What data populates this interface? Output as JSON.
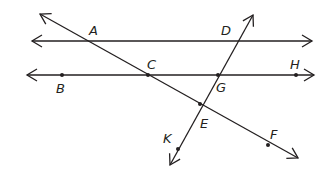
{
  "diagram": {
    "type": "geometry-parallel-lines-transversals",
    "stroke_color": "#231f20",
    "background": "#ffffff",
    "lines": [
      {
        "name": "line-AD",
        "kind": "line",
        "from": [
          32,
          41
        ],
        "to": [
          312,
          41
        ],
        "through": [
          "A",
          "D"
        ]
      },
      {
        "name": "line-BH",
        "kind": "line",
        "from": [
          27,
          75
        ],
        "to": [
          314,
          75
        ],
        "through": [
          "B",
          "C",
          "G",
          "H"
        ]
      },
      {
        "name": "line-ACEF",
        "kind": "line",
        "from": [
          40,
          14
        ],
        "to": [
          298,
          158
        ],
        "through": [
          "A",
          "C",
          "E",
          "F"
        ]
      },
      {
        "name": "line-DGEK",
        "kind": "line",
        "from": [
          253,
          15
        ],
        "to": [
          170,
          165
        ],
        "through": [
          "D",
          "G",
          "E",
          "K"
        ]
      }
    ],
    "points": [
      {
        "label": "A",
        "x": 88,
        "y": 41,
        "dot": false,
        "label_x": 89,
        "label_y": 24
      },
      {
        "label": "D",
        "x": 236,
        "y": 41,
        "dot": false,
        "label_x": 221,
        "label_y": 24
      },
      {
        "label": "B",
        "x": 62,
        "y": 75,
        "dot": true,
        "label_x": 56,
        "label_y": 82
      },
      {
        "label": "C",
        "x": 148,
        "y": 75,
        "dot": true,
        "label_x": 147,
        "label_y": 58
      },
      {
        "label": "G",
        "x": 218,
        "y": 75,
        "dot": true,
        "label_x": 216,
        "label_y": 81
      },
      {
        "label": "H",
        "x": 296,
        "y": 75,
        "dot": true,
        "label_x": 290,
        "label_y": 58
      },
      {
        "label": "E",
        "x": 200,
        "y": 104,
        "dot": true,
        "label_x": 200,
        "label_y": 117
      },
      {
        "label": "F",
        "x": 268,
        "y": 145,
        "dot": true,
        "label_x": 270,
        "label_y": 128
      },
      {
        "label": "K",
        "x": 178,
        "y": 149,
        "dot": true,
        "label_x": 163,
        "label_y": 132
      }
    ]
  }
}
